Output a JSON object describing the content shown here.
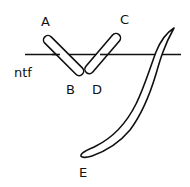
{
  "diagram": {
    "labels": {
      "a": "A",
      "b": "B",
      "c": "C",
      "d": "D",
      "e": "E",
      "ntf": "ntf"
    },
    "elements": [
      {
        "id": "reference-line",
        "label": "ntf",
        "type": "horizontal-line"
      },
      {
        "id": "segment-AB",
        "from": "A",
        "to": "B",
        "type": "capsule"
      },
      {
        "id": "segment-CD",
        "from": "C",
        "to": "D",
        "type": "capsule"
      },
      {
        "id": "curved-blade",
        "end": "E",
        "type": "curved-elongated-shape"
      }
    ],
    "colors": {
      "stroke": "#111111",
      "background": "#ffffff"
    }
  }
}
